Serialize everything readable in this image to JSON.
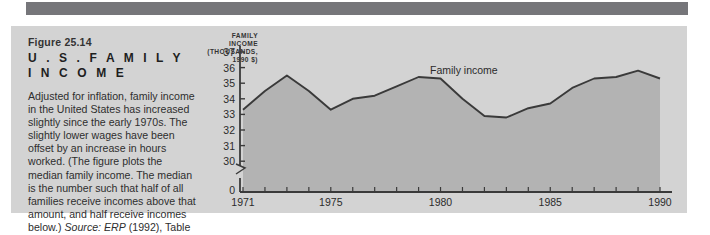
{
  "figure": {
    "number": "Figure 25.14",
    "title_line1": "U . S .  F A M I L Y",
    "title_line2": "I N C O M E",
    "body": "Adjusted for inflation, family income in the United States has increased slightly since the early 1970s. The slightly lower wages have been offset by an increase in hours worked. (The figure plots the median family income. The median is the number such that half of all families receive incomes above that amount, and half receive incomes below.) ",
    "source_italic": "Source: ERP",
    "source_tail": " (1992), Table B-28."
  },
  "colors": {
    "panel_bg": "#d3d3d3",
    "top_bar": "#76767a",
    "area_fill": "#b3b3b3",
    "line": "#3a3a3a",
    "text": "#2b2b2b"
  },
  "chart_data": {
    "type": "area",
    "title": "",
    "axis_title_lines": [
      "FAMILY",
      "INCOME",
      "(THOUSANDS,",
      "1990 $)"
    ],
    "ylabel": "FAMILY INCOME (THOUSANDS, 1990 $)",
    "xlabel": "",
    "grid": false,
    "legend_position": "inline",
    "series_label": "Family income",
    "ylim": [
      30,
      37
    ],
    "y_ticks": [
      37,
      36,
      35,
      34,
      33,
      32,
      31,
      30
    ],
    "y_axis_break": true,
    "y_origin_label": "0",
    "xlim": [
      1971,
      1990
    ],
    "x_ticks_labeled": [
      1971,
      1975,
      1980,
      1985,
      1990
    ],
    "x_ticks_all": [
      1971,
      1972,
      1973,
      1974,
      1975,
      1976,
      1977,
      1978,
      1979,
      1980,
      1981,
      1982,
      1983,
      1984,
      1985,
      1986,
      1987,
      1988,
      1989,
      1990
    ],
    "x": [
      1971,
      1972,
      1973,
      1974,
      1975,
      1976,
      1977,
      1978,
      1979,
      1980,
      1981,
      1982,
      1983,
      1984,
      1985,
      1986,
      1987,
      1988,
      1989,
      1990
    ],
    "values": [
      33.3,
      34.5,
      35.5,
      34.5,
      33.3,
      34.0,
      34.2,
      34.8,
      35.4,
      35.3,
      34.0,
      32.9,
      32.8,
      33.4,
      33.7,
      34.7,
      35.3,
      35.4,
      35.8,
      35.3
    ]
  }
}
